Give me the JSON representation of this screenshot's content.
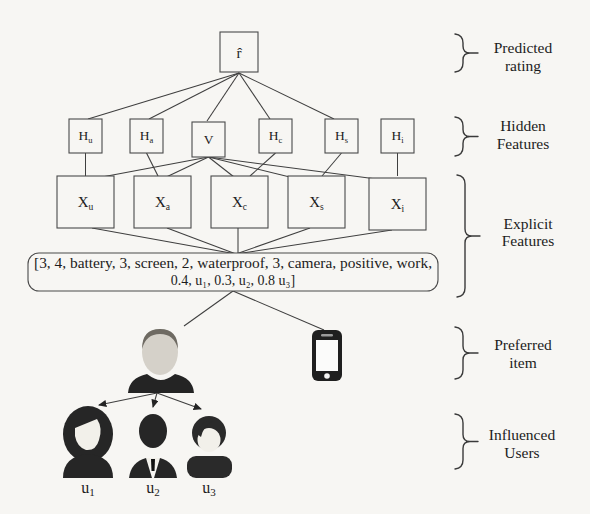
{
  "figure": {
    "predicted_node": {
      "main": "r̂"
    },
    "hidden_nodes": [
      {
        "main": "H",
        "sub": "u"
      },
      {
        "main": "H",
        "sub": "a"
      },
      {
        "main": "V",
        "sub": ""
      },
      {
        "main": "H",
        "sub": "c"
      },
      {
        "main": "H",
        "sub": "s"
      },
      {
        "main": "H",
        "sub": "i"
      }
    ],
    "explicit_nodes": [
      {
        "main": "X",
        "sub": "u"
      },
      {
        "main": "X",
        "sub": "a"
      },
      {
        "main": "X",
        "sub": "c"
      },
      {
        "main": "X",
        "sub": "s"
      },
      {
        "main": "X",
        "sub": "i"
      }
    ],
    "feature_vector": {
      "line1": "[3, 4, battery, 3, screen, 2, waterproof, 3, camera, positive, work,",
      "line2": "0.4, u₁, 0.3, u₂, 0.8 u₃]"
    },
    "user_labels": [
      {
        "main": "u",
        "sub": "1"
      },
      {
        "main": "u",
        "sub": "2"
      },
      {
        "main": "u",
        "sub": "3"
      }
    ],
    "side_labels": [
      {
        "line1": "Predicted",
        "line2": "rating"
      },
      {
        "line1": "Hidden",
        "line2": "Features"
      },
      {
        "line1": "Explicit",
        "line2": "Features"
      },
      {
        "line1": "Preferred",
        "line2": "item"
      },
      {
        "line1": "Influenced",
        "line2": "Users"
      }
    ],
    "icons": {
      "preferred_user": "person-silhouette-icon",
      "item": "smartphone-icon",
      "influenced_users": [
        "woman-silhouette-icon",
        "man-suit-silhouette-icon",
        "person-silhouette-icon"
      ]
    },
    "colors": {
      "background": "#f7f6f3",
      "line": "#3f3f3f",
      "text": "#1c1c1c",
      "silhouette": "#262626",
      "face": "#f2f0ea",
      "head_skin": "#d5d1c9"
    }
  }
}
